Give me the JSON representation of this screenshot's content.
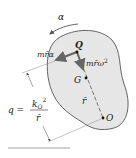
{
  "diagram": {
    "labels": {
      "alpha": "α",
      "tangential_force": "mr̄α",
      "normal_force": "mr̄ω",
      "normal_force_exp": "2",
      "point_q": "Q",
      "point_g": "G",
      "point_o": "O",
      "r_bar": "r̄",
      "q_lhs": "q =",
      "q_num": "k",
      "q_num_sub": "O",
      "q_num_exp": "2",
      "q_den": "r̄"
    },
    "colors": {
      "body_fill": "#e6e6e6",
      "body_stroke": "#555555",
      "vector": "#666666",
      "line": "#777777"
    }
  }
}
